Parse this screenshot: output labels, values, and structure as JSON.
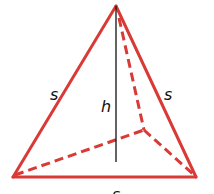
{
  "figure": {
    "colors": {
      "edge": "#d93a36",
      "height": "#111111"
    },
    "labels": {
      "edge_left": "s",
      "edge_right": "s",
      "edge_bottom": "s",
      "height": "h"
    }
  }
}
